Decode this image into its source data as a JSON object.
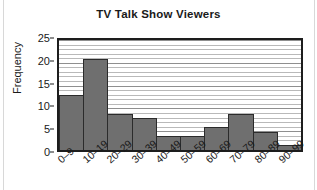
{
  "chart_data": {
    "type": "bar",
    "title": "TV Talk Show Viewers",
    "xlabel": "",
    "ylabel": "Frequency",
    "categories": [
      "0–9",
      "10–19",
      "20–29",
      "30–39",
      "40–49",
      "50–59",
      "60–69",
      "70–79",
      "80–89",
      "90–99"
    ],
    "values": [
      12,
      20,
      8,
      7,
      3,
      3,
      5,
      8,
      4,
      1
    ],
    "ylim": [
      0,
      25
    ],
    "yticks": [
      0,
      5,
      10,
      15,
      20,
      25
    ],
    "ytick_labels": [
      "0",
      "5",
      "10",
      "15",
      "20",
      "25"
    ],
    "grid": true,
    "grid_minor_step": 1,
    "legend": null,
    "bar_color": "#6f6f6f",
    "bar_edge_color": "#2b2b2b",
    "axis_color": "#1d1d1d",
    "background_color": "#ffffff",
    "histogram_style": true
  }
}
